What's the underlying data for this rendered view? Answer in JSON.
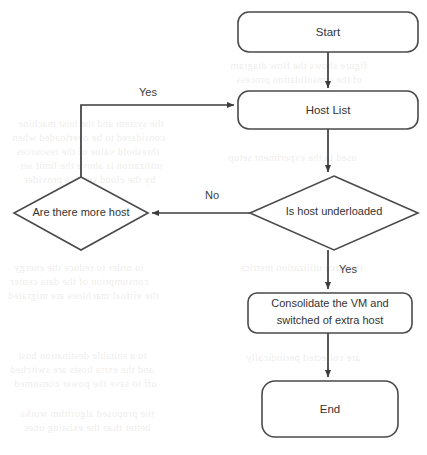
{
  "diagram": {
    "type": "flowchart",
    "background_color": "#ffffff",
    "stroke_color": "#4a4a4a",
    "text_color": "#333333",
    "nodes": [
      {
        "id": "start",
        "shape": "rounded-rect",
        "label": "Start",
        "x": 238,
        "y": 12,
        "w": 180,
        "h": 40
      },
      {
        "id": "host_list",
        "shape": "rounded-rect",
        "label": "Host List",
        "x": 238,
        "y": 91,
        "w": 180,
        "h": 38
      },
      {
        "id": "more_host",
        "shape": "diamond",
        "label": "Are there more host",
        "x": 14,
        "y": 177,
        "w": 134,
        "h": 73
      },
      {
        "id": "underloaded",
        "shape": "diamond",
        "label": "Is host underloaded",
        "x": 250,
        "y": 176,
        "w": 168,
        "h": 74
      },
      {
        "id": "consolidate",
        "shape": "rounded-rect",
        "label_line1": "Consolidate the VM and",
        "label_line2": "switched of extra host",
        "x": 248,
        "y": 293,
        "w": 164,
        "h": 40
      },
      {
        "id": "end",
        "shape": "rounded-rect",
        "label": "End",
        "x": 262,
        "y": 381,
        "w": 136,
        "h": 56
      }
    ],
    "edges": [
      {
        "id": "start-to-hostlist",
        "from": "start",
        "to": "host_list",
        "label": ""
      },
      {
        "id": "hostlist-to-underloaded",
        "from": "host_list",
        "to": "underloaded",
        "label": ""
      },
      {
        "id": "underloaded-to-morehost",
        "from": "underloaded",
        "to": "more_host",
        "label": "No",
        "label_x": 212,
        "label_y": 196
      },
      {
        "id": "morehost-to-hostlist",
        "from": "more_host",
        "to": "host_list",
        "label": "Yes",
        "label_x": 148,
        "label_y": 93
      },
      {
        "id": "underloaded-to-consolidate",
        "from": "underloaded",
        "to": "consolidate",
        "label": "Yes",
        "label_x": 348,
        "label_y": 270
      },
      {
        "id": "consolidate-to-end",
        "from": "consolidate",
        "to": "end",
        "label": ""
      }
    ]
  },
  "ghost_text": {
    "note": "faint scanned page bleed-through, illegible",
    "lines": [
      {
        "text": "the system and the host machine",
        "x": 18,
        "y": 118
      },
      {
        "text": "considered to be overloaded when",
        "x": 12,
        "y": 132
      },
      {
        "text": "threshold value of the resources",
        "x": 16,
        "y": 146
      },
      {
        "text": "utilization is above the limit set",
        "x": 20,
        "y": 160
      },
      {
        "text": "by the cloud service provider",
        "x": 24,
        "y": 174
      },
      {
        "text": "in order to reduce the energy",
        "x": 14,
        "y": 262
      },
      {
        "text": "consumption of the data center",
        "x": 10,
        "y": 276
      },
      {
        "text": "the virtual machines are migrated",
        "x": 8,
        "y": 290
      },
      {
        "text": "to a suitable destination host",
        "x": 18,
        "y": 350
      },
      {
        "text": "and the extra hosts are switched",
        "x": 10,
        "y": 364
      },
      {
        "text": "off to save the power consumed",
        "x": 14,
        "y": 378
      },
      {
        "text": "the proposed algorithm works",
        "x": 20,
        "y": 408
      },
      {
        "text": "better than the existing ones",
        "x": 24,
        "y": 422
      },
      {
        "text": "figure shows the flow diagram",
        "x": 230,
        "y": 60
      },
      {
        "text": "of the consolidation process",
        "x": 236,
        "y": 74
      },
      {
        "text": "used in the experiment setup",
        "x": 228,
        "y": 152
      },
      {
        "text": "resource utilization metrics",
        "x": 240,
        "y": 262
      },
      {
        "text": "are collected periodically",
        "x": 246,
        "y": 352
      }
    ]
  }
}
